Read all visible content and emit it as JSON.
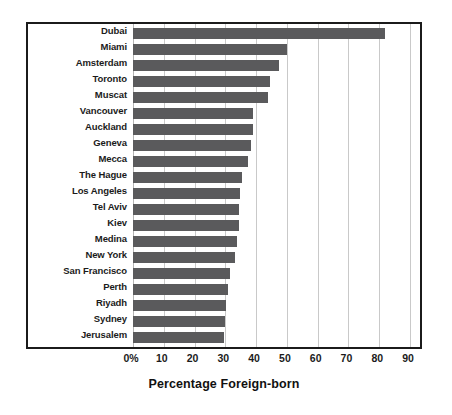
{
  "chart_data": {
    "type": "bar",
    "orientation": "horizontal",
    "title": "",
    "xlabel": "Percentage Foreign-born",
    "ylabel": "",
    "xlim": [
      0,
      95
    ],
    "grid": true,
    "legend": null,
    "bar_color": "#5a5a5c",
    "frame_color": "#1b1b1b",
    "gridline_color": "#c9c9c9",
    "xticks": [
      {
        "value": 0,
        "label": "0%"
      },
      {
        "value": 10,
        "label": "10"
      },
      {
        "value": 20,
        "label": "20"
      },
      {
        "value": 30,
        "label": "30"
      },
      {
        "value": 40,
        "label": "40"
      },
      {
        "value": 50,
        "label": "50"
      },
      {
        "value": 60,
        "label": "60"
      },
      {
        "value": 70,
        "label": "70"
      },
      {
        "value": 80,
        "label": "80"
      },
      {
        "value": 90,
        "label": "90"
      }
    ],
    "categories": [
      "Dubai",
      "Miami",
      "Amsterdam",
      "Toronto",
      "Muscat",
      "Vancouver",
      "Auckland",
      "Geneva",
      "Mecca",
      "The Hague",
      "Los Angeles",
      "Tel Aviv",
      "Kiev",
      "Medina",
      "New York",
      "San Francisco",
      "Perth",
      "Riyadh",
      "Sydney",
      "Jerusalem"
    ],
    "values": [
      82.0,
      50.0,
      47.5,
      44.5,
      44.0,
      39.0,
      39.0,
      38.3,
      37.3,
      35.5,
      34.8,
      34.5,
      34.5,
      33.8,
      33.0,
      31.5,
      30.8,
      30.2,
      30.0,
      29.7
    ]
  }
}
